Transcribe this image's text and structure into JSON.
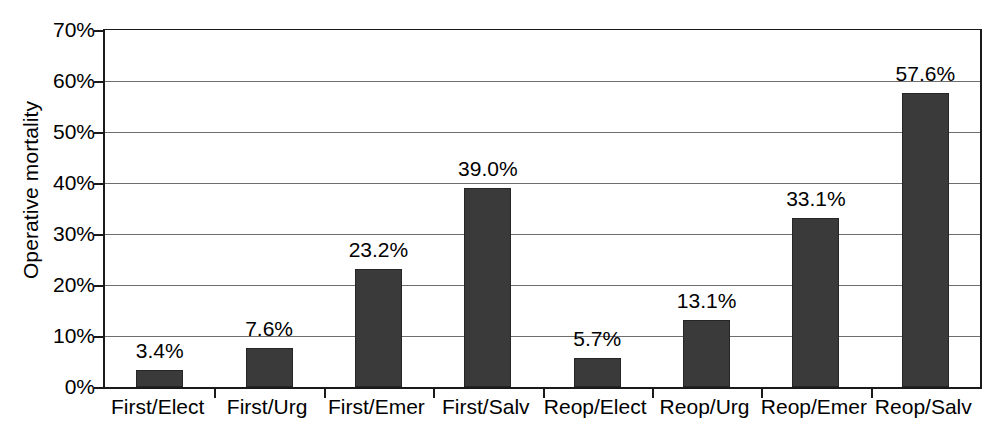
{
  "chart_data": {
    "type": "bar",
    "title": "",
    "xlabel": "",
    "ylabel": "Operative mortality",
    "categories": [
      "First/Elect",
      "First/Urg",
      "First/Emer",
      "First/Salv",
      "Reop/Elect",
      "Reop/Urg",
      "Reop/Emer",
      "Reop/Salv"
    ],
    "values": [
      3.4,
      7.6,
      23.2,
      39.0,
      5.7,
      13.1,
      33.1,
      57.6
    ],
    "value_labels": [
      "3.4%",
      "7.6%",
      "23.2%",
      "39.0%",
      "5.7%",
      "13.1%",
      "33.1%",
      "57.6%"
    ],
    "ylim": [
      0,
      70
    ],
    "ytick_values": [
      0,
      10,
      20,
      30,
      40,
      50,
      60,
      70
    ],
    "ytick_labels": [
      "0%",
      "10%",
      "20%",
      "30%",
      "40%",
      "50%",
      "60%",
      "70%"
    ],
    "grid": "horizontal",
    "legend": "none",
    "units": "percent",
    "colors": {
      "bar_fill": "#3a3a3a",
      "bar_edge": "#262626",
      "axis": "#1a1a1a",
      "gridline": "#6e6e6e",
      "background": "#ffffff",
      "text": "#000000"
    }
  }
}
